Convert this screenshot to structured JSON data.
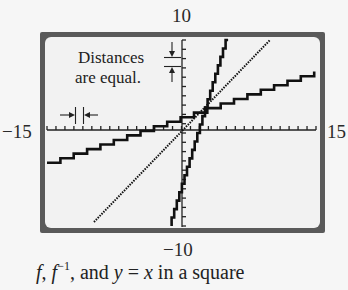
{
  "chart_data": {
    "type": "line",
    "title": "",
    "caption": "f, f⁻¹, and y = x in a square",
    "xlim": [
      -15,
      15
    ],
    "ylim": [
      -10,
      10
    ],
    "xlabel": "",
    "ylabel": "",
    "tick_labels": {
      "x_min": "−15",
      "x_max": "15",
      "y_max": "10",
      "y_min": "−10"
    },
    "grid": false,
    "x_tick_step": 1,
    "y_tick_step": 1,
    "series": [
      {
        "name": "f (steep)",
        "x": [
          -1.1,
          5.2
        ],
        "y": [
          -10,
          10
        ],
        "style": "stepped"
      },
      {
        "name": "y = x",
        "x": [
          -9.8,
          9.8
        ],
        "y": [
          -9.8,
          9.8
        ],
        "style": "dotted"
      },
      {
        "name": "f⁻¹ (shallow)",
        "x": [
          -15,
          14.8
        ],
        "y": [
          -3.2,
          6.6
        ],
        "style": "stepped"
      }
    ],
    "annotations": [
      {
        "text": "Distances are equal.",
        "note": "tick spacing on x-axis equals tick spacing on y-axis"
      }
    ]
  },
  "labels": {
    "y_max": "10",
    "y_min": "−10",
    "x_min": "−15",
    "x_max": "15",
    "annotation_line1": "Distances",
    "annotation_line2": "are equal."
  },
  "caption": {
    "f": "f",
    "sep": ", ",
    "finv_base": "f",
    "finv_exp": "−1",
    "mid": ", and ",
    "y": "y",
    "eq": " = ",
    "x": "x",
    "tail": " in a square"
  },
  "colors": {
    "frame": "#5a5a5a",
    "screen": "#f2f2f2",
    "ink": "#111111"
  }
}
